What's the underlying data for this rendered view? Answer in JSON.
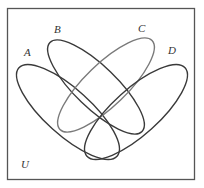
{
  "diagram": {
    "type": "venn",
    "universe_label": "U",
    "sets": [
      {
        "id": "A",
        "label": "A",
        "stroke": "#3a3a3a"
      },
      {
        "id": "B",
        "label": "B",
        "stroke": "#3a3a3a"
      },
      {
        "id": "C",
        "label": "C",
        "stroke": "#7a7a7a"
      },
      {
        "id": "D",
        "label": "D",
        "stroke": "#3a3a3a"
      }
    ],
    "frame_stroke": "#555555",
    "background": "#ffffff"
  }
}
